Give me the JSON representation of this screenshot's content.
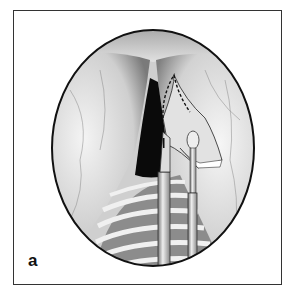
{
  "figure": {
    "panel_label": "a",
    "colors": {
      "frame": "#333333",
      "ellipse_outline": "#111111",
      "tissue_light": "#e8e8e8",
      "tissue_shadow": "#9a9a9a",
      "cleft": "#0a0a0a"
    }
  }
}
